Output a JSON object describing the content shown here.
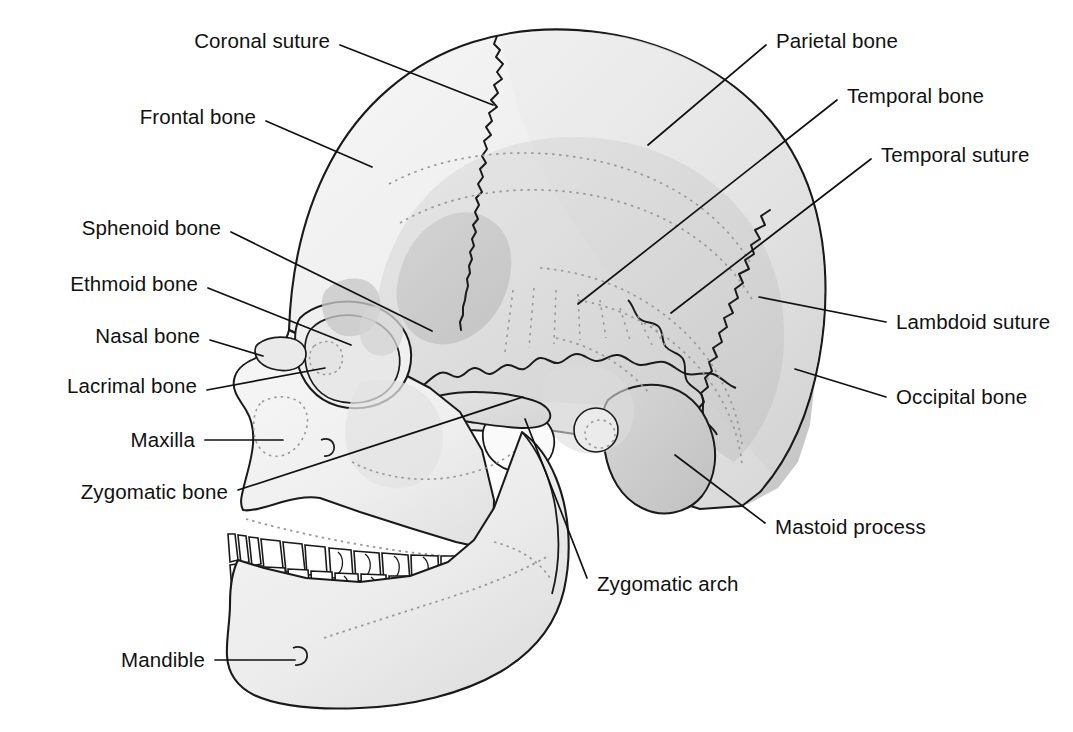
{
  "figure": {
    "view": "left lateral",
    "background_color": "#ffffff",
    "line_color": "#1a1a1a",
    "text_color": "#111111"
  },
  "palette": {
    "bone_light": "#f2f2f2",
    "bone_mid": "#e0e0e0",
    "bone_shade": "#cfcfcf",
    "bone_dark": "#bdbdbd",
    "tooth_white": "#ffffff",
    "outline": "#1a1a1a",
    "dotted_suture": "#9a9a9a",
    "leader_line": "#111111"
  },
  "labels": [
    {
      "id": "coronal-suture",
      "text": "Coronal suture",
      "side": "left",
      "text_x": 330,
      "text_y": 41,
      "leader": [
        [
          340,
          45
        ],
        [
          493,
          105
        ]
      ]
    },
    {
      "id": "frontal-bone",
      "text": "Frontal bone",
      "side": "left",
      "text_x": 256,
      "text_y": 117,
      "leader": [
        [
          266,
          121
        ],
        [
          372,
          167
        ]
      ]
    },
    {
      "id": "sphenoid-bone",
      "text": "Sphenoid bone",
      "side": "left",
      "text_x": 221,
      "text_y": 228,
      "leader": [
        [
          231,
          232
        ],
        [
          432,
          331
        ]
      ]
    },
    {
      "id": "ethmoid-bone",
      "text": "Ethmoid bone",
      "side": "left",
      "text_x": 198,
      "text_y": 284,
      "leader": [
        [
          208,
          288
        ],
        [
          351,
          345
        ]
      ]
    },
    {
      "id": "nasal-bone",
      "text": "Nasal bone",
      "side": "left",
      "text_x": 200,
      "text_y": 336,
      "leader": [
        [
          210,
          340
        ],
        [
          263,
          356
        ]
      ]
    },
    {
      "id": "lacrimal-bone",
      "text": "Lacrimal bone",
      "side": "left",
      "text_x": 197,
      "text_y": 386,
      "leader": [
        [
          207,
          390
        ],
        [
          325,
          368
        ]
      ]
    },
    {
      "id": "maxilla",
      "text": "Maxilla",
      "side": "left",
      "text_x": 195,
      "text_y": 440,
      "leader": [
        [
          205,
          440
        ],
        [
          283,
          440
        ]
      ]
    },
    {
      "id": "zygomatic-bone",
      "text": "Zygomatic bone",
      "side": "left",
      "text_x": 228,
      "text_y": 492,
      "leader": [
        [
          238,
          490
        ],
        [
          523,
          397
        ]
      ]
    },
    {
      "id": "mandible",
      "text": "Mandible",
      "side": "left",
      "text_x": 205,
      "text_y": 660,
      "leader": [
        [
          215,
          660
        ],
        [
          295,
          660
        ]
      ]
    },
    {
      "id": "parietal-bone",
      "text": "Parietal bone",
      "side": "right",
      "text_x": 776,
      "text_y": 41,
      "leader": [
        [
          766,
          45
        ],
        [
          648,
          145
        ]
      ]
    },
    {
      "id": "temporal-bone",
      "text": "Temporal bone",
      "side": "right",
      "text_x": 847,
      "text_y": 96,
      "leader": [
        [
          837,
          100
        ],
        [
          578,
          304
        ]
      ]
    },
    {
      "id": "temporal-suture",
      "text": "Temporal suture",
      "side": "right",
      "text_x": 881,
      "text_y": 155,
      "leader": [
        [
          871,
          159
        ],
        [
          671,
          313
        ]
      ]
    },
    {
      "id": "lambdoid-suture",
      "text": "Lambdoid suture",
      "side": "right",
      "text_x": 896,
      "text_y": 322,
      "leader": [
        [
          886,
          322
        ],
        [
          759,
          297
        ]
      ]
    },
    {
      "id": "occipital-bone",
      "text": "Occipital bone",
      "side": "right",
      "text_x": 896,
      "text_y": 397,
      "leader": [
        [
          886,
          397
        ],
        [
          795,
          369
        ]
      ]
    },
    {
      "id": "mastoid-process",
      "text": "Mastoid process",
      "side": "right",
      "text_x": 775,
      "text_y": 527,
      "leader": [
        [
          765,
          523
        ],
        [
          675,
          455
        ]
      ]
    },
    {
      "id": "zygomatic-arch",
      "text": "Zygomatic arch",
      "side": "right",
      "text_x": 597,
      "text_y": 584,
      "leader": [
        [
          587,
          578
        ],
        [
          525,
          419
        ]
      ]
    }
  ],
  "structures": [
    "frontal bone",
    "parietal bone",
    "temporal bone",
    "occipital bone",
    "sphenoid bone",
    "ethmoid bone",
    "nasal bone",
    "lacrimal bone",
    "zygomatic bone",
    "maxilla",
    "mandible",
    "coronal suture",
    "temporal suture",
    "lambdoid suture",
    "zygomatic arch",
    "mastoid process"
  ]
}
